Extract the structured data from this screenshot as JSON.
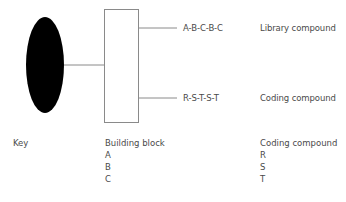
{
  "diagram": {
    "solid_support": {
      "shape": "ellipse",
      "fill": "#000000"
    },
    "building_block_box": {
      "shape": "rectangle",
      "stroke": "#8a8a8a"
    },
    "branches": [
      {
        "sequence": "A-B-C-B-C",
        "label": "Library compound"
      },
      {
        "sequence": "R-S-T-S-T",
        "label": "Coding compound"
      }
    ]
  },
  "key": {
    "title": "Key",
    "building_block": {
      "header": "Building block",
      "items": [
        "A",
        "B",
        "C"
      ]
    },
    "coding_compound": {
      "header": "Coding compound",
      "items": [
        "R",
        "S",
        "T"
      ]
    }
  },
  "colors": {
    "line": "#8a8a8a",
    "text": "#4a4a4a",
    "ellipse": "#000000"
  }
}
